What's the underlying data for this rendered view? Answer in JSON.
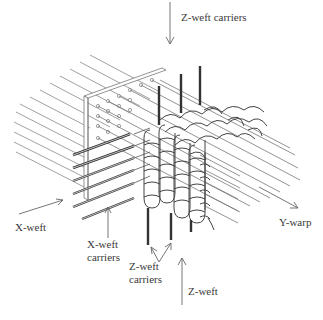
{
  "diagram": {
    "labels": {
      "z_weft_carriers_top": "Z-weft carriers",
      "x_weft": "X-weft",
      "x_weft_carriers_1": "X-weft",
      "x_weft_carriers_2": "carriers",
      "z_weft_carriers_bottom_1": "Z-weft",
      "z_weft_carriers_bottom_2": "carriers",
      "z_weft_bottom": "Z-weft",
      "y_warp": "Y-warp"
    },
    "colors": {
      "line": "#666666",
      "dark": "#333333",
      "text": "#3a3a3a"
    }
  }
}
